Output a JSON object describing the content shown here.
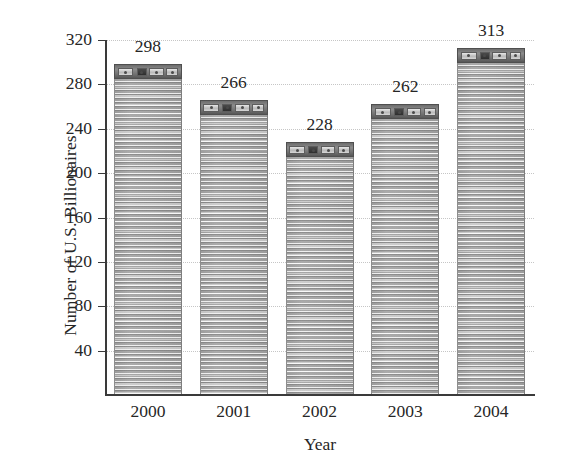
{
  "chart_data": {
    "type": "bar",
    "title": "",
    "subtitle": "",
    "categories": [
      "2000",
      "2001",
      "2002",
      "2003",
      "2004"
    ],
    "values": [
      298,
      266,
      228,
      262,
      313
    ],
    "data_labels": [
      "298",
      "266",
      "228",
      "262",
      "313"
    ],
    "xlabel": "Year",
    "ylabel": "Number of U.S. Billionaires",
    "ylim": [
      0,
      320
    ],
    "yticks": [
      40,
      80,
      120,
      160,
      200,
      240,
      280,
      320
    ],
    "ytick_labels": [
      "40",
      "80",
      "120",
      "160",
      "200",
      "240",
      "280",
      "320"
    ],
    "xtick_labels": [
      "2000",
      "2001",
      "2002",
      "2003",
      "2004"
    ],
    "grid": "horizontal-dotted",
    "legend": "none",
    "bar_fill": "#b0b0b0",
    "bar_cap_fill": "#6d6d6d",
    "gridline_color": "#c6c6c6",
    "axis_color": "#3a3a3a",
    "text_color": "#262626",
    "background_color": "#ffffff"
  },
  "axes": {
    "y_title": "Number of U.S. Billionaires",
    "x_title": "Year"
  }
}
